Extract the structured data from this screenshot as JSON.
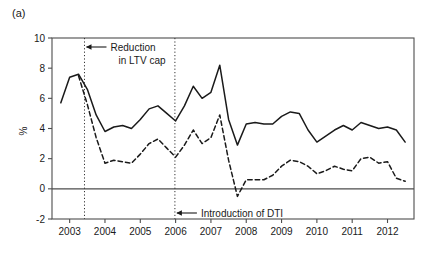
{
  "panel": {
    "label": "(a)"
  },
  "chart_data": {
    "type": "line",
    "title": "",
    "subtitle": "",
    "xlabel": "",
    "ylabel": "%",
    "xlim": [
      2002.5,
      2012.75
    ],
    "ylim": [
      -2,
      10
    ],
    "grid": false,
    "legend": "none",
    "y_ticks": [
      -2,
      0,
      2,
      4,
      6,
      8,
      10
    ],
    "y_tick_labels": [
      "-2",
      "0",
      "2",
      "4",
      "6",
      "8",
      "10"
    ],
    "x_ticks": [
      2003,
      2004,
      2005,
      2006,
      2007,
      2008,
      2009,
      2010,
      2011,
      2012
    ],
    "x_tick_labels": [
      "2003",
      "2004",
      "2005",
      "2006",
      "2007",
      "2008",
      "2009",
      "2010",
      "2011",
      "2012"
    ],
    "zero_line": 0,
    "series": [
      {
        "name": "solid-series",
        "style": "solid",
        "color": "#1a1a1a",
        "x": [
          2002.75,
          2003.0,
          2003.25,
          2003.5,
          2003.75,
          2004.0,
          2004.25,
          2004.5,
          2004.75,
          2005.0,
          2005.25,
          2005.5,
          2005.75,
          2006.0,
          2006.25,
          2006.5,
          2006.75,
          2007.0,
          2007.25,
          2007.5,
          2007.75,
          2008.0,
          2008.25,
          2008.5,
          2008.75,
          2009.0,
          2009.25,
          2009.5,
          2009.75,
          2010.0,
          2010.25,
          2010.5,
          2010.75,
          2011.0,
          2011.25,
          2011.5,
          2011.75,
          2012.0,
          2012.25,
          2012.5
        ],
        "values": [
          5.7,
          7.4,
          7.6,
          6.6,
          4.9,
          3.8,
          4.1,
          4.2,
          4.0,
          4.6,
          5.3,
          5.5,
          5.0,
          4.5,
          5.5,
          6.8,
          6.0,
          6.4,
          8.2,
          4.6,
          2.9,
          4.3,
          4.4,
          4.3,
          4.3,
          4.8,
          5.1,
          5.0,
          3.9,
          3.1,
          3.5,
          3.9,
          4.2,
          3.9,
          4.4,
          4.2,
          4.0,
          4.1,
          3.9,
          3.1
        ]
      },
      {
        "name": "dashed-series",
        "style": "dashed",
        "color": "#1a1a1a",
        "x": [
          2003.25,
          2003.5,
          2003.75,
          2004.0,
          2004.25,
          2004.5,
          2004.75,
          2005.0,
          2005.25,
          2005.5,
          2005.75,
          2006.0,
          2006.25,
          2006.5,
          2006.75,
          2007.0,
          2007.25,
          2007.5,
          2007.75,
          2008.0,
          2008.25,
          2008.5,
          2008.75,
          2009.0,
          2009.25,
          2009.5,
          2009.75,
          2010.0,
          2010.25,
          2010.5,
          2010.75,
          2011.0,
          2011.25,
          2011.5,
          2011.75,
          2012.0,
          2012.25,
          2012.5
        ],
        "values": [
          7.5,
          5.6,
          3.4,
          1.7,
          1.9,
          1.8,
          1.7,
          2.3,
          3.0,
          3.3,
          2.7,
          2.1,
          2.9,
          3.9,
          3.0,
          3.4,
          4.9,
          1.9,
          -0.5,
          0.6,
          0.6,
          0.6,
          0.9,
          1.5,
          1.9,
          1.8,
          1.5,
          1.0,
          1.2,
          1.5,
          1.3,
          1.2,
          2.0,
          2.1,
          1.7,
          1.8,
          0.7,
          0.5
        ]
      }
    ],
    "annotations": [
      {
        "name": "ltv-cap",
        "text_line1": "Reduction",
        "text_line2": "in LTV cap",
        "vline_x": 2003.42,
        "arrow": "left"
      },
      {
        "name": "dti-intro",
        "text_line1": "Introduction of DTI",
        "text_line2": "",
        "vline_x": 2005.98,
        "arrow": "left"
      }
    ]
  }
}
